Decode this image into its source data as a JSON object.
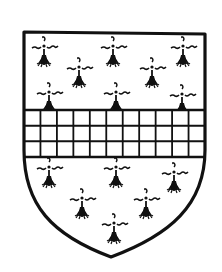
{
  "figure": {
    "colors": {
      "background": "#ffffff",
      "ink": "#111111"
    },
    "shield": {
      "top_left": [
        23,
        31
      ],
      "top_right": [
        205,
        33
      ],
      "bottom_point": [
        111,
        257
      ]
    },
    "fess": {
      "top": 110,
      "bottom": 157,
      "rows": 3,
      "columns": 11
    },
    "ermine_spots": [
      {
        "x": 44,
        "y": 55
      },
      {
        "x": 113,
        "y": 55
      },
      {
        "x": 183,
        "y": 55
      },
      {
        "x": 79,
        "y": 76
      },
      {
        "x": 152,
        "y": 76
      },
      {
        "x": 49,
        "y": 101
      },
      {
        "x": 116,
        "y": 101
      },
      {
        "x": 182,
        "y": 103
      },
      {
        "x": 49,
        "y": 176
      },
      {
        "x": 116,
        "y": 176
      },
      {
        "x": 174,
        "y": 181
      },
      {
        "x": 82,
        "y": 207
      },
      {
        "x": 146,
        "y": 207
      },
      {
        "x": 114,
        "y": 232
      }
    ]
  }
}
